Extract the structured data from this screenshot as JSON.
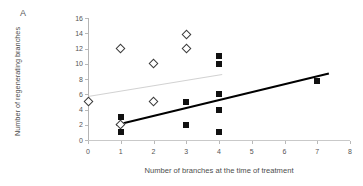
{
  "panel": {
    "label": "A"
  },
  "chart_data": {
    "type": "scatter",
    "title": "",
    "xlabel": "Number of branches at the time of treatment",
    "ylabel": "Number of regenerating branches",
    "xlim": [
      0,
      8
    ],
    "ylim": [
      0,
      16
    ],
    "xticks": [
      0,
      1,
      2,
      3,
      4,
      5,
      6,
      7,
      8
    ],
    "yticks": [
      0,
      2,
      4,
      6,
      8,
      10,
      12,
      14,
      16
    ],
    "grid": false,
    "legend": "none",
    "series": [
      {
        "name": "open-diamond-group",
        "marker": "open-diamond",
        "color": "#3b3b3b",
        "points": [
          {
            "x": 0,
            "y": 5
          },
          {
            "x": 1,
            "y": 12
          },
          {
            "x": 1,
            "y": 2
          },
          {
            "x": 2,
            "y": 10
          },
          {
            "x": 2,
            "y": 5
          },
          {
            "x": 3,
            "y": 13.8
          },
          {
            "x": 3,
            "y": 12
          }
        ]
      },
      {
        "name": "filled-square-group",
        "marker": "filled-square",
        "color": "#111111",
        "points": [
          {
            "x": 1,
            "y": 3
          },
          {
            "x": 1,
            "y": 1
          },
          {
            "x": 3,
            "y": 5
          },
          {
            "x": 3,
            "y": 2
          },
          {
            "x": 4,
            "y": 11
          },
          {
            "x": 4,
            "y": 10
          },
          {
            "x": 4,
            "y": 6
          },
          {
            "x": 4,
            "y": 4
          },
          {
            "x": 4,
            "y": 1
          },
          {
            "x": 7,
            "y": 7.7
          }
        ]
      }
    ],
    "trendlines": [
      {
        "name": "grey-regression-line",
        "color": "#d2d2d2",
        "x0": 0,
        "y0": 5.8,
        "x1": 4.1,
        "y1": 8.7
      },
      {
        "name": "black-regression-line",
        "color": "#000000",
        "x0": 0.85,
        "y0": 2.1,
        "x1": 7.35,
        "y1": 8.85
      }
    ]
  }
}
